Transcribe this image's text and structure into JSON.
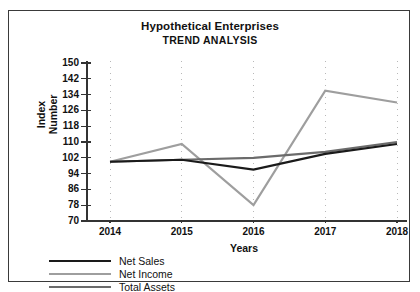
{
  "title": {
    "line1": "Hypothetical Enterprises",
    "line2": "TREND ANALYSIS"
  },
  "axes": {
    "y_title": "Index\nNumber",
    "x_title": "Years"
  },
  "colors": {
    "net_sales": "#1a1a1a",
    "net_income": "#9e9e9e",
    "total_assets": "#6b6b6b",
    "axis": "#333333",
    "grid": "#b8b8b8",
    "border": "#3a3a3a",
    "background": "#ffffff"
  },
  "legend": {
    "items": [
      {
        "label": "Net Sales",
        "color": "#1a1a1a"
      },
      {
        "label": "Net Income",
        "color": "#9e9e9e"
      },
      {
        "label": "Total Assets",
        "color": "#6b6b6b"
      }
    ]
  },
  "chart_data": {
    "type": "line",
    "title": "Hypothetical Enterprises TREND ANALYSIS",
    "xlabel": "Years",
    "ylabel": "Index Number",
    "categories": [
      "2014",
      "2015",
      "2016",
      "2017",
      "2018"
    ],
    "x": [
      2014,
      2015,
      2016,
      2017,
      2018
    ],
    "ylim": [
      70,
      150
    ],
    "ytick_step": 8,
    "yticks": [
      70,
      78,
      86,
      94,
      102,
      110,
      118,
      126,
      134,
      142,
      150
    ],
    "grid": "vertical-dotted",
    "legend_position": "below-left",
    "series": [
      {
        "name": "Net Sales",
        "color": "#1a1a1a",
        "values": [
          100,
          101,
          96,
          104,
          109
        ]
      },
      {
        "name": "Net Income",
        "color": "#9e9e9e",
        "values": [
          100,
          109,
          78,
          136,
          130
        ]
      },
      {
        "name": "Total Assets",
        "color": "#6b6b6b",
        "values": [
          100,
          101,
          102,
          105,
          110
        ]
      }
    ]
  }
}
